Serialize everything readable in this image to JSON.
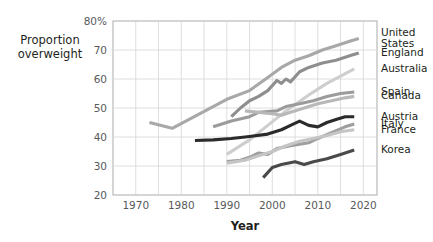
{
  "chart_data": {
    "type": "line",
    "title": "",
    "xlabel": "Year",
    "ylabel": "Proportion overweight",
    "xlim": [
      1965,
      2023
    ],
    "ylim": [
      20,
      80
    ],
    "xticks": [
      1970,
      1980,
      1990,
      2000,
      2010,
      2020
    ],
    "yticks": [
      20,
      30,
      40,
      50,
      60,
      70,
      80
    ],
    "ytick_labels": [
      "20",
      "30",
      "40",
      "50",
      "60",
      "70",
      "80%"
    ],
    "xtick_labels": [
      "1970",
      "1980",
      "1990",
      "2000",
      "2010",
      "2020"
    ],
    "grid": true,
    "grid_x_step": 5,
    "grid_y_step": 10,
    "legend_position": "right-outside",
    "series": [
      {
        "name": "United States",
        "color": "#a8a8a8",
        "label_y": 74.0,
        "points": [
          [
            1973,
            45.0
          ],
          [
            1978,
            43.0
          ],
          [
            1990,
            53.0
          ],
          [
            1995,
            56.0
          ],
          [
            1999,
            60.5
          ],
          [
            2002,
            64.0
          ],
          [
            2005,
            66.5
          ],
          [
            2008,
            68.0
          ],
          [
            2011,
            70.0
          ],
          [
            2014,
            71.5
          ],
          [
            2017,
            73.0
          ],
          [
            2019,
            74.0
          ]
        ]
      },
      {
        "name": "England",
        "color": "#8e8e8e",
        "label_y": 69.0,
        "points": [
          [
            1991,
            47.0
          ],
          [
            1993,
            50.0
          ],
          [
            1995,
            52.5
          ],
          [
            1997,
            54.0
          ],
          [
            1999,
            56.0
          ],
          [
            2001,
            59.5
          ],
          [
            2002,
            58.5
          ],
          [
            2003,
            60.0
          ],
          [
            2004,
            59.0
          ],
          [
            2006,
            62.5
          ],
          [
            2008,
            64.0
          ],
          [
            2011,
            65.5
          ],
          [
            2014,
            66.5
          ],
          [
            2017,
            68.0
          ],
          [
            2019,
            69.0
          ]
        ]
      },
      {
        "name": "Australia",
        "color": "#cecece",
        "label_y": 63.5,
        "points": [
          [
            1990,
            34.0
          ],
          [
            1995,
            39.0
          ],
          [
            1999,
            44.0
          ],
          [
            2003,
            49.0
          ],
          [
            2008,
            54.5
          ],
          [
            2012,
            58.5
          ],
          [
            2015,
            61.0
          ],
          [
            2018,
            63.5
          ]
        ]
      },
      {
        "name": "Spain",
        "color": "#9b9b9b",
        "label_y": 55.5,
        "points": [
          [
            1987,
            43.5
          ],
          [
            1991,
            45.5
          ],
          [
            1995,
            47.0
          ],
          [
            1997,
            48.5
          ],
          [
            2001,
            49.0
          ],
          [
            2003,
            50.5
          ],
          [
            2006,
            51.5
          ],
          [
            2009,
            52.5
          ],
          [
            2012,
            54.0
          ],
          [
            2015,
            55.0
          ],
          [
            2018,
            55.5
          ]
        ]
      },
      {
        "name": "Canada",
        "color": "#b8b8b8",
        "label_y": 54.0,
        "points": [
          [
            1994,
            49.0
          ],
          [
            1997,
            48.5
          ],
          [
            2000,
            48.0
          ],
          [
            2002,
            47.5
          ],
          [
            2004,
            48.5
          ],
          [
            2007,
            50.0
          ],
          [
            2010,
            51.5
          ],
          [
            2013,
            52.5
          ],
          [
            2016,
            53.5
          ],
          [
            2018,
            54.0
          ]
        ]
      },
      {
        "name": "Austria",
        "color": "#2b2b2b",
        "label_y": 47.0,
        "points": [
          [
            1983,
            38.8
          ],
          [
            1987,
            39.0
          ],
          [
            1991,
            39.5
          ],
          [
            1995,
            40.2
          ],
          [
            1999,
            41.0
          ],
          [
            2002,
            42.5
          ],
          [
            2004,
            44.0
          ],
          [
            2006,
            45.5
          ],
          [
            2008,
            44.0
          ],
          [
            2010,
            43.5
          ],
          [
            2012,
            45.0
          ],
          [
            2014,
            46.0
          ],
          [
            2016,
            47.0
          ],
          [
            2018,
            47.0
          ]
        ]
      },
      {
        "name": "Italy",
        "color": "#9e9e9e",
        "label_y": 44.5,
        "points": [
          [
            1990,
            31.5
          ],
          [
            1993,
            32.0
          ],
          [
            1995,
            33.0
          ],
          [
            1997,
            34.5
          ],
          [
            1999,
            34.0
          ],
          [
            2001,
            36.0
          ],
          [
            2004,
            37.0
          ],
          [
            2006,
            37.5
          ],
          [
            2008,
            38.0
          ],
          [
            2010,
            39.5
          ],
          [
            2013,
            41.5
          ],
          [
            2016,
            43.5
          ],
          [
            2018,
            44.5
          ]
        ]
      },
      {
        "name": "France",
        "color": "#c5c5c5",
        "label_y": 42.5,
        "points": [
          [
            1990,
            31.0
          ],
          [
            1994,
            32.0
          ],
          [
            1997,
            33.5
          ],
          [
            2000,
            35.0
          ],
          [
            2003,
            37.0
          ],
          [
            2006,
            38.5
          ],
          [
            2009,
            39.5
          ],
          [
            2012,
            40.5
          ],
          [
            2015,
            41.8
          ],
          [
            2018,
            42.5
          ]
        ]
      },
      {
        "name": "Korea",
        "color": "#4a4a4a",
        "label_y": 35.5,
        "points": [
          [
            1998,
            26.0
          ],
          [
            2000,
            29.5
          ],
          [
            2002,
            30.5
          ],
          [
            2005,
            31.5
          ],
          [
            2007,
            30.5
          ],
          [
            2009,
            31.5
          ],
          [
            2012,
            32.5
          ],
          [
            2015,
            34.0
          ],
          [
            2018,
            35.5
          ]
        ]
      }
    ]
  },
  "legend": {
    "groups": [
      {
        "labels": [
          "United",
          "States"
        ],
        "anchor_series": "United States"
      },
      {
        "labels": [
          "England"
        ],
        "anchor_series": "England"
      },
      {
        "labels": [
          "Australia"
        ],
        "anchor_series": "Australia"
      },
      {
        "labels": [
          "Spain"
        ],
        "anchor_series": "Spain"
      },
      {
        "labels": [
          "Canada"
        ],
        "anchor_series": "Canada"
      },
      {
        "labels": [
          "Austria"
        ],
        "anchor_series": "Austria"
      },
      {
        "labels": [
          "Italy"
        ],
        "anchor_series": "Italy"
      },
      {
        "labels": [
          "France"
        ],
        "anchor_series": "France"
      },
      {
        "labels": [
          "Korea"
        ],
        "anchor_series": "Korea"
      }
    ]
  },
  "axes": {
    "y_title_line1": "Proportion",
    "y_title_line2": "overweight",
    "x_title": "Year"
  },
  "colors": {
    "grid": "#d6d6d6",
    "border": "#b3b3b3",
    "tick_text": "#58595b",
    "title_text": "#231f20",
    "background": "#ffffff"
  }
}
